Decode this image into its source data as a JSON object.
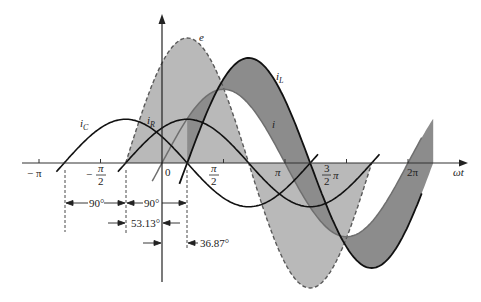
{
  "chart_data": {
    "type": "line",
    "title": "",
    "xlabel": "ωt",
    "ylabel": "",
    "x_ticks": [
      "−π",
      "−π/2",
      "0",
      "π/2",
      "π",
      "3/2 π",
      "2π"
    ],
    "series": [
      {
        "name": "e",
        "amplitude": 1.0,
        "phase_deg": 53.13,
        "style": "dashed",
        "fill": "light-gray"
      },
      {
        "name": "i_L",
        "amplitude": 0.84,
        "phase_deg": -36.87,
        "style": "solid-thick"
      },
      {
        "name": "i",
        "amplitude": 0.59,
        "phase_deg": 0,
        "style": "solid-gray"
      },
      {
        "name": "i_R",
        "amplitude": 0.35,
        "phase_deg": 53.13,
        "style": "solid-thick"
      },
      {
        "name": "i_C",
        "amplitude": 0.35,
        "phase_deg": 143.13,
        "style": "solid-thick"
      }
    ],
    "annotations": [
      "90°",
      "90°",
      "53.13°",
      "36.87°"
    ]
  },
  "labels": {
    "e": "e",
    "iL_main": "i",
    "iL_sub": "L",
    "i": "i",
    "iR_main": "i",
    "iR_sub": "R",
    "iC_main": "i",
    "iC_sub": "C",
    "omega_t": "ωt"
  },
  "ticks": {
    "neg_pi": "− π",
    "neg_half_pi_num": "π",
    "neg_half_pi_den": "2",
    "neg_sign": "−",
    "zero": "0",
    "half_pi_num": "π",
    "half_pi_den": "2",
    "pi": "π",
    "three_half_num": "3",
    "three_half_den": "2",
    "three_half_pi": "π",
    "two_pi": "2π"
  },
  "annotations": {
    "a90_left": "90°",
    "a90_right": "90°",
    "a53": "53.13°",
    "a37": "36.87°"
  },
  "colors": {
    "e_fill": "#b9b9b9",
    "diff_fill": "#8c8c8c",
    "line": "#111111",
    "i_line": "#6f6f6f",
    "e_line": "#5a5a5a"
  }
}
